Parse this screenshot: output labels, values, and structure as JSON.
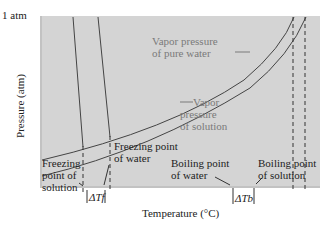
{
  "diagram": {
    "type": "phase-diagram-vapor-pressure",
    "y_axis": {
      "top_tick": "1 atm",
      "label": "Pressure (atm)"
    },
    "x_axis": {
      "label": "Temperature (°C)"
    },
    "curves": {
      "pure_water": "Vapor pressure of pure water",
      "solution": "Vapor pressure of solution"
    },
    "annotations": {
      "freezing_solution": [
        "Freezing",
        "point of",
        "solution"
      ],
      "freezing_water": [
        "Freezing point",
        "of water"
      ],
      "boiling_water": [
        "Boiling point",
        "of water"
      ],
      "boiling_solution": [
        "Boiling point",
        "of solution"
      ],
      "vp_pure_line1": "Vapor pressure",
      "vp_pure_line2": "of pure water",
      "vp_sol_line1": "Vapor",
      "vp_sol_line2": "pressure",
      "vp_sol_line3": "of solution",
      "delta_tf": "ΔTf",
      "delta_tb": "ΔTb"
    },
    "colors": {
      "plot_bg": "#d4d4d4",
      "line": "#444444",
      "label_gray": "#7a7a7a"
    }
  }
}
